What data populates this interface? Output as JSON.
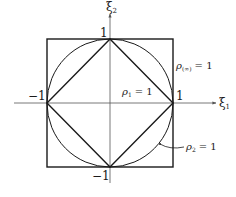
{
  "figure": {
    "colors": {
      "stroke": "#1a1a1a",
      "axis": "#555555",
      "background": "#ffffff"
    },
    "axes": {
      "x_label_sym": "ξ",
      "x_label_sub": "1",
      "y_label_sym": "ξ",
      "y_label_sub": "2"
    },
    "ticks": {
      "top": "1",
      "right": "1",
      "left": "−1",
      "bottom": "−1"
    },
    "shapes": [
      {
        "name": "square",
        "label_sym": "ρ",
        "label_sub": "(∞)",
        "label_eq": "= 1"
      },
      {
        "name": "diamond",
        "label_sym": "ρ",
        "label_sub": "1",
        "label_eq": "= 1"
      },
      {
        "name": "circle",
        "label_sym": "ρ",
        "label_sub": "2",
        "label_eq": "= 1"
      }
    ]
  }
}
